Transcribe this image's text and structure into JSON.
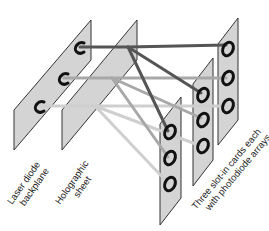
{
  "diagram": {
    "labels": {
      "laser": [
        "Laser diode",
        "backplane"
      ],
      "holo": [
        "Holographic",
        "sheet"
      ],
      "cards": [
        "Three slot-in cards each",
        "with photodiode arrays"
      ]
    },
    "colors": {
      "panel_fill": "#d4d4d4",
      "panel_edge": "#333333",
      "beam_dark": "#555555",
      "beam_mid": "#a8a8a8",
      "beam_light": "#cfcfcf",
      "ring": "#111111"
    },
    "components": [
      {
        "id": "laser-backplane",
        "emitters": 3
      },
      {
        "id": "holographic-sheet"
      },
      {
        "id": "card-rear",
        "detectors": 3
      },
      {
        "id": "card-middle",
        "detectors": 3
      },
      {
        "id": "card-front",
        "detectors": 3
      }
    ]
  }
}
